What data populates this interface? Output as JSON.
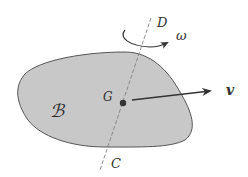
{
  "diagram": {
    "body_label": "ℬ",
    "center_label": "G",
    "velocity_label": "v",
    "angular_velocity_label": "ω",
    "axis_top_label": "D",
    "axis_bottom_label": "C",
    "colors": {
      "body_fill": "#c8c8c8",
      "body_stroke": "#555555",
      "arrow": "#333333",
      "axis": "#777777",
      "background": "#ffffff"
    }
  }
}
